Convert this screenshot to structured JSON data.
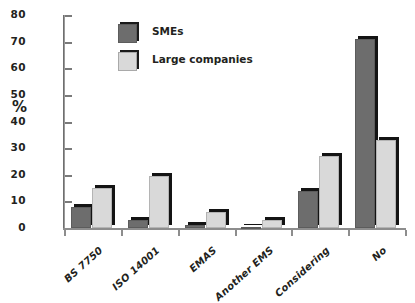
{
  "chart_data": {
    "type": "bar",
    "title": "",
    "subtitle": "",
    "xlabel": "",
    "ylabel": "%",
    "ylim": [
      0,
      80
    ],
    "yticks": [
      0,
      10,
      20,
      30,
      40,
      50,
      60,
      70,
      80
    ],
    "ytick_labels": [
      "0",
      "10",
      "20",
      "30",
      "40",
      "50",
      "60",
      "70",
      "80"
    ],
    "grid": false,
    "legend_position": "top-left-inside",
    "categories": [
      "BS 7750",
      "ISO 14001",
      "EMAS",
      "Another EMS",
      "Considering",
      "No"
    ],
    "series": [
      {
        "name": "SMEs",
        "color": "#6d6d6d",
        "values": [
          8,
          3,
          1,
          0.4,
          14,
          71
        ]
      },
      {
        "name": "Large companies",
        "color": "#d9d9d9",
        "values": [
          15,
          19.5,
          6,
          3,
          27,
          33
        ]
      }
    ]
  },
  "legend": {
    "items": [
      {
        "label": "SMEs"
      },
      {
        "label": "Large companies"
      }
    ]
  },
  "axis": {
    "y_title": "%"
  }
}
